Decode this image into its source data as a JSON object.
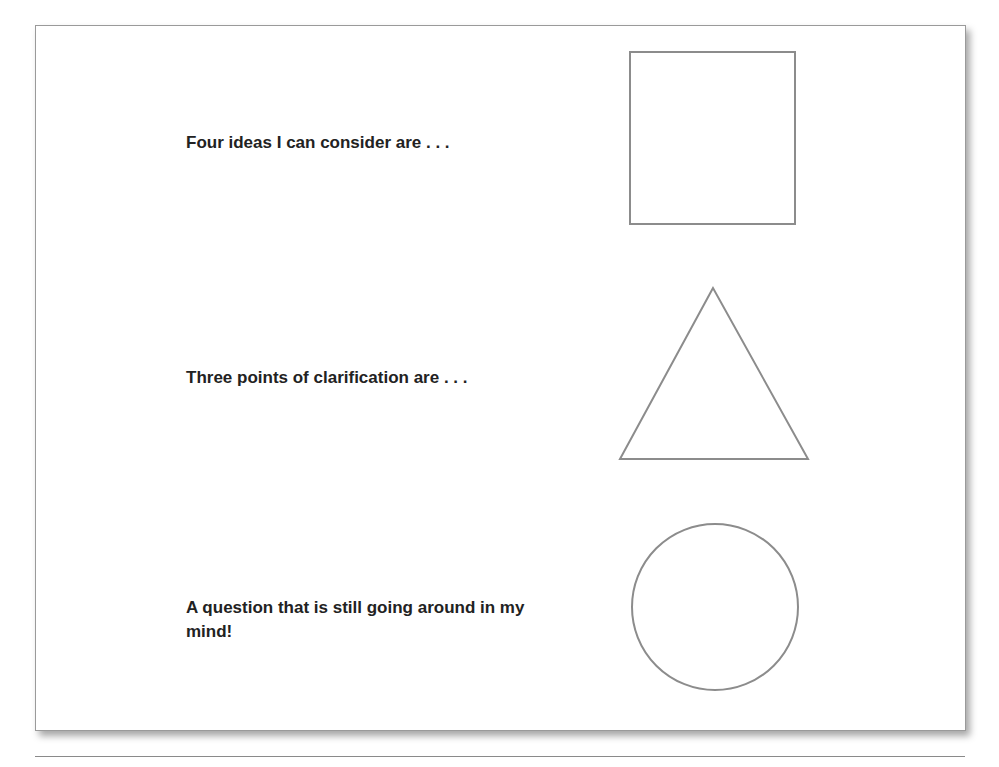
{
  "worksheet": {
    "rows": [
      {
        "prompt": "Four ideas I can consider are . . .",
        "shape": "square"
      },
      {
        "prompt": "Three points of clarification are . . .",
        "shape": "triangle"
      },
      {
        "prompt": "A question that is still going around in my mind!",
        "shape": "circle"
      }
    ],
    "colors": {
      "outline": "#8c8c8c",
      "text": "#222222"
    }
  }
}
